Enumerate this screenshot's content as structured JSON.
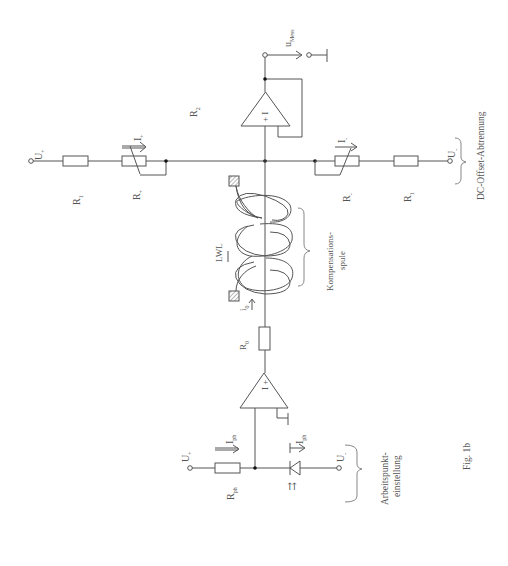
{
  "figure": {
    "caption": "Fig. 1b",
    "orientation": "rotated 90° counter-clockwise (text reads bottom-to-top)"
  },
  "labels": {
    "u_plus_left": "U",
    "u_plus_left_sub": "+",
    "u_minus_right": "U",
    "u_minus_right_sub": "-",
    "r1_left": "R",
    "r1_left_sub": "1",
    "r_plus": "R",
    "r_plus_sub": "+",
    "i_plus": "I",
    "i_plus_sub": "+",
    "r2": "R",
    "r2_sub": "2",
    "r_minus": "R",
    "r_minus_sub": "-",
    "i_minus": "I",
    "i_minus_sub": "-",
    "r1_right": "R",
    "r1_right_sub": "1",
    "u_mess": "u",
    "u_mess_sub": "Mess",
    "opamp_upper_signs": "+ I",
    "opamp_lower_signs": "I +",
    "lwl": "LWL",
    "kompensationsspule_1": "Kompensations-",
    "kompensationsspule_2": "spule",
    "dc_offset": "DC-Offset-Abtrennung",
    "i0": "i",
    "i0_sub": "0",
    "r0": "R",
    "r0_sub": "0",
    "u_plus_bottom": "U",
    "u_plus_bottom_sub": "+",
    "u_minus_bottom": "U",
    "u_minus_bottom_sub": "-",
    "rph": "R",
    "rph_sub": "ph",
    "iph_left": "I",
    "iph_left_sub": "ph",
    "iph_right": "I",
    "iph_right_sub": "ph",
    "photodiode_light": "⇈",
    "arbeitspunkt_1": "Arbeitspunkt-",
    "arbeitspunkt_2": "einstellung"
  },
  "colors": {
    "line": "#555555",
    "node": "#111111",
    "hatch": "#888888",
    "background": "#ffffff"
  }
}
